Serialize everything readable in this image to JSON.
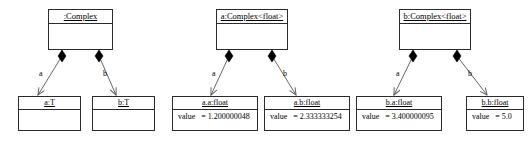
{
  "diagram": {
    "type": "uml-object-diagram",
    "colors": {
      "stroke": "#2b2b2b",
      "fill": "#ffffff",
      "text": "#000000",
      "diamond": "#000000",
      "link": "#555555"
    },
    "groups": [
      {
        "id": "group-generic",
        "parent": {
          "name": ":Complex",
          "slots": []
        },
        "links": [
          {
            "role": "a",
            "kind": "composition"
          },
          {
            "role": "b",
            "kind": "composition"
          }
        ],
        "children": [
          {
            "name": "a:T",
            "slots": []
          },
          {
            "name": "b:T",
            "slots": []
          }
        ]
      },
      {
        "id": "group-a",
        "parent": {
          "name": "a:Complex<float>",
          "slots": []
        },
        "links": [
          {
            "role": "a",
            "kind": "composition"
          },
          {
            "role": "b",
            "kind": "composition"
          }
        ],
        "children": [
          {
            "name": "a.a:float",
            "slots": [
              {
                "name": "value",
                "eq": "=",
                "value": "1.200000048"
              }
            ]
          },
          {
            "name": "a.b:float",
            "slots": [
              {
                "name": "value",
                "eq": "=",
                "value": "2.333333254"
              }
            ]
          }
        ]
      },
      {
        "id": "group-b",
        "parent": {
          "name": "b:Complex<float>",
          "slots": []
        },
        "links": [
          {
            "role": "a",
            "kind": "composition"
          },
          {
            "role": "b",
            "kind": "composition"
          }
        ],
        "children": [
          {
            "name": "b.a:float",
            "slots": [
              {
                "name": "value",
                "eq": "=",
                "value": "3.400000095"
              }
            ]
          },
          {
            "name": "b.b:float",
            "slots": [
              {
                "name": "value",
                "eq": "=",
                "value": "5.0"
              }
            ]
          }
        ]
      }
    ]
  }
}
